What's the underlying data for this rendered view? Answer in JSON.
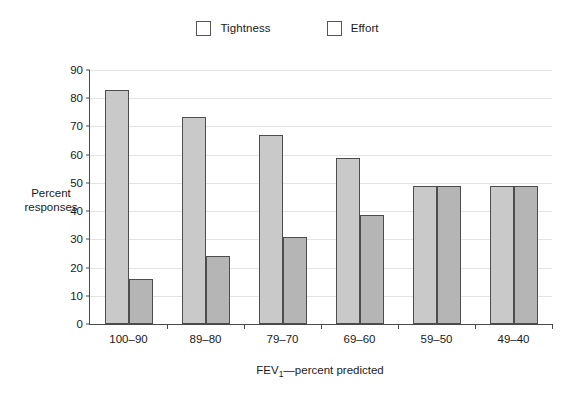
{
  "chart_data": {
    "type": "bar",
    "title": "",
    "xlabel": "FEV₁—percent predicted",
    "ylabel": "Percent responses",
    "categories": [
      "100–90",
      "89–80",
      "79–70",
      "69–60",
      "59–50",
      "49–40"
    ],
    "series": [
      {
        "name": "Tightness",
        "color": "#c9c9c9",
        "values": [
          83,
          73.5,
          67,
          59,
          49,
          49
        ]
      },
      {
        "name": "Effort",
        "color": "#b5b5b5",
        "values": [
          16,
          24,
          31,
          38.5,
          49,
          49
        ]
      }
    ],
    "ylim": [
      0,
      90
    ],
    "ytick_step": 10,
    "yticks": [
      "0",
      "10",
      "20",
      "30",
      "40",
      "50",
      "60",
      "70",
      "80",
      "90"
    ],
    "grid": "horizontal",
    "legend_position": "top-center"
  },
  "axes": {
    "y_title_line1": "Percent",
    "y_title_line2": "responses",
    "x_title_main": "FEV",
    "x_title_sub": "1",
    "x_title_rest": "—percent predicted"
  },
  "legend": {
    "entries": [
      {
        "label": "Tightness",
        "swatch": "legend-swatch-tightness"
      },
      {
        "label": "Effort",
        "swatch": "legend-swatch-effort"
      }
    ]
  }
}
